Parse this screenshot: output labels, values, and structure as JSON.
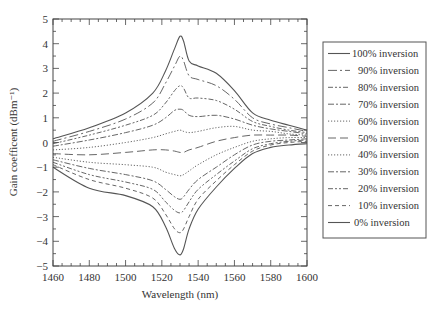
{
  "chart_data": {
    "type": "line",
    "title": "",
    "xlabel": "Wavelength (nm)",
    "ylabel": "Gain coefficent (dBm⁻¹)",
    "xlim": [
      1460,
      1600
    ],
    "ylim": [
      -5,
      5
    ],
    "xticks": [
      1460,
      1480,
      1500,
      1520,
      1540,
      1560,
      1580,
      1600
    ],
    "yticks": [
      5,
      4,
      3,
      2,
      1,
      0,
      -1,
      -2,
      -3,
      -4,
      -5
    ],
    "grid": false,
    "legend_position": "right-outside",
    "x": [
      1460,
      1480,
      1500,
      1515,
      1522,
      1527,
      1530,
      1532,
      1535,
      1540,
      1550,
      1560,
      1570,
      1580,
      1590,
      1600
    ],
    "series": [
      {
        "name": "100% inversion",
        "dash": "solid",
        "values": [
          0.15,
          0.6,
          1.2,
          2.0,
          2.9,
          3.8,
          4.3,
          4.1,
          3.3,
          3.1,
          2.8,
          2.1,
          1.2,
          0.9,
          0.7,
          0.5
        ]
      },
      {
        "name": "90% inversion",
        "dash": "longdashdot",
        "values": [
          0.05,
          0.45,
          0.95,
          1.6,
          2.4,
          3.1,
          3.5,
          3.3,
          2.7,
          2.55,
          2.3,
          1.75,
          1.0,
          0.75,
          0.6,
          0.45
        ]
      },
      {
        "name": "80% inversion",
        "dash": "dashdotdot",
        "values": [
          -0.05,
          0.3,
          0.7,
          1.1,
          1.6,
          2.1,
          2.3,
          2.2,
          1.8,
          1.8,
          1.7,
          1.35,
          0.85,
          0.65,
          0.5,
          0.4
        ]
      },
      {
        "name": "70% inversion",
        "dash": "dashdot",
        "values": [
          -0.15,
          0.1,
          0.4,
          0.7,
          1.0,
          1.3,
          1.35,
          1.3,
          1.1,
          1.05,
          1.1,
          0.95,
          0.7,
          0.55,
          0.45,
          0.35
        ]
      },
      {
        "name": "60% inversion",
        "dash": "dotted",
        "values": [
          -0.3,
          -0.2,
          0.0,
          0.2,
          0.35,
          0.45,
          0.5,
          0.45,
          0.4,
          0.45,
          0.6,
          0.65,
          0.5,
          0.45,
          0.35,
          0.3
        ]
      },
      {
        "name": "50% inversion",
        "dash": "longdash",
        "values": [
          -0.45,
          -0.5,
          -0.4,
          -0.3,
          -0.3,
          -0.35,
          -0.4,
          -0.4,
          -0.3,
          -0.2,
          0.05,
          0.2,
          0.3,
          0.3,
          0.3,
          0.25
        ]
      },
      {
        "name": "40% inversion",
        "dash": "dotted",
        "values": [
          -0.6,
          -0.8,
          -0.9,
          -1.0,
          -1.2,
          -1.3,
          -1.35,
          -1.3,
          -1.15,
          -0.9,
          -0.5,
          -0.2,
          0.05,
          0.15,
          0.2,
          0.2
        ]
      },
      {
        "name": "30% inversion",
        "dash": "dashdot",
        "values": [
          -0.7,
          -1.05,
          -1.3,
          -1.55,
          -1.9,
          -2.2,
          -2.3,
          -2.2,
          -1.9,
          -1.5,
          -1.0,
          -0.5,
          -0.1,
          0.05,
          0.1,
          0.15
        ]
      },
      {
        "name": "20% inversion",
        "dash": "dashdotdot",
        "values": [
          -0.8,
          -1.3,
          -1.6,
          -1.9,
          -2.4,
          -2.75,
          -2.85,
          -2.75,
          -2.4,
          -1.9,
          -1.3,
          -0.75,
          -0.25,
          -0.05,
          0.05,
          0.1
        ]
      },
      {
        "name": "10% inversion",
        "dash": "dashed",
        "values": [
          -0.9,
          -1.5,
          -1.85,
          -2.25,
          -2.9,
          -3.5,
          -3.65,
          -3.5,
          -3.0,
          -2.3,
          -1.55,
          -0.9,
          -0.35,
          -0.1,
          0.0,
          0.05
        ]
      },
      {
        "name": "0% inversion",
        "dash": "solid",
        "values": [
          -1.0,
          -1.85,
          -2.15,
          -2.6,
          -3.4,
          -4.3,
          -4.55,
          -4.3,
          -3.5,
          -2.7,
          -1.8,
          -1.05,
          -0.45,
          -0.2,
          -0.1,
          -0.05
        ]
      }
    ]
  },
  "legend": {
    "items": [
      "100% inversion",
      "90% inversion",
      "80% inversion",
      "70% inversion",
      "60% inversion",
      "50% inversion",
      "40% inversion",
      "30% inversion",
      "20% inversion",
      "10% inversion",
      "0% inversion"
    ]
  },
  "colors": {
    "line": "#555555",
    "axis": "#444444",
    "text": "#333333"
  }
}
